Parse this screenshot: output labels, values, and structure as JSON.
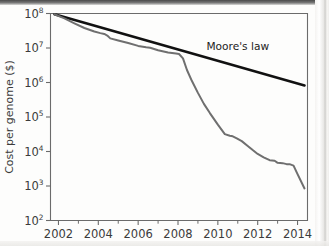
{
  "figure": {
    "background_color": "#fdfdfc",
    "moore_line_color": "#111111",
    "cost_line_color": "#6f6f6f",
    "axis_color": "#6b6b6b"
  },
  "chart_data": {
    "type": "line",
    "title": "",
    "xlabel": "",
    "ylabel": "Cost per genome ($)",
    "yscale": "log",
    "xlim": [
      2001.6,
      2014.5
    ],
    "ylim": [
      100,
      100000000
    ],
    "grid": false,
    "legend": "none",
    "y_tick_labels": [
      "10⁸",
      "10⁷",
      "10⁶",
      "10⁵",
      "10⁴",
      "10³",
      "10²"
    ],
    "y_tick_values": [
      100000000,
      10000000,
      1000000,
      100000,
      10000,
      1000,
      100
    ],
    "y_tick_bases": [
      "10",
      "10",
      "10",
      "10",
      "10",
      "10",
      "10"
    ],
    "y_tick_exponents": [
      "8",
      "7",
      "6",
      "5",
      "4",
      "3",
      "2"
    ],
    "x_tick_labels": [
      "2002",
      "2004",
      "2006",
      "2008",
      "2010",
      "2012",
      "2014"
    ],
    "x_tick_values": [
      2002,
      2004,
      2006,
      2008,
      2010,
      2012,
      2014
    ],
    "x_minor_ticks": [
      2003,
      2005,
      2007,
      2009,
      2011,
      2013
    ],
    "annotations": [
      {
        "text": "Moore's law",
        "x": 2011.0,
        "y": 9000000
      }
    ],
    "series": [
      {
        "name": "Moore's law",
        "color": "#111111",
        "width": 2.6,
        "x": [
          2001.8,
          2014.35
        ],
        "y": [
          95000000,
          820000
        ]
      },
      {
        "name": "Cost per genome",
        "color": "#6f6f6f",
        "width": 2.0,
        "x": [
          2001.8,
          2002.3,
          2002.8,
          2003.3,
          2003.8,
          2004.1,
          2004.3,
          2004.45,
          2004.6,
          2005.0,
          2005.5,
          2006.0,
          2006.4,
          2006.6,
          2007.0,
          2007.5,
          2007.9,
          2008.05,
          2008.25,
          2008.45,
          2008.7,
          2009.0,
          2009.3,
          2009.6,
          2010.0,
          2010.35,
          2010.6,
          2010.75,
          2010.95,
          2011.2,
          2011.5,
          2011.75,
          2012.0,
          2012.3,
          2012.6,
          2012.85,
          2013.0,
          2013.25,
          2013.45,
          2013.6,
          2013.8,
          2014.0,
          2014.35
        ],
        "y": [
          95000000,
          72000000,
          52000000,
          38000000,
          30000000,
          27000000,
          25500000,
          23000000,
          19000000,
          16500000,
          14000000,
          11500000,
          10500000,
          10200000,
          8600000,
          7400000,
          6900000,
          6700000,
          5000000,
          2300000,
          1100000,
          500000,
          240000,
          130000,
          60000,
          32000,
          28500,
          27500,
          24000,
          20000,
          14500,
          11000,
          8500,
          6800,
          5600,
          5400,
          4700,
          4600,
          4300,
          4300,
          3900,
          2200,
          850
        ]
      }
    ]
  },
  "axis": {
    "ylabel": "Cost per genome ($)"
  }
}
